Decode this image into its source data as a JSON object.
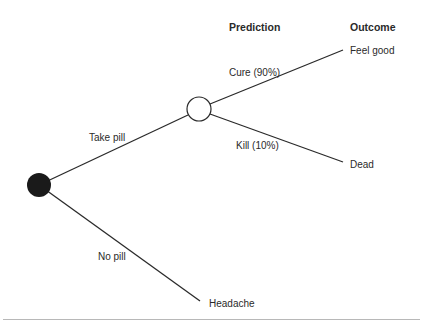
{
  "headers": {
    "prediction": "Prediction",
    "outcome": "Outcome"
  },
  "branches": {
    "take_pill": "Take pill",
    "no_pill": "No pill",
    "cure": "Cure (90%)",
    "kill": "Kill (10%)"
  },
  "outcomes": {
    "feel_good": "Feel good",
    "dead": "Dead",
    "headache": "Headache"
  },
  "nodes": {
    "decision": {
      "type": "decision-node",
      "fill": "#1a1a1a"
    },
    "chance": {
      "type": "chance-node",
      "fill": "#ffffff"
    }
  },
  "colors": {
    "line": "#2a2a2a",
    "rule": "#b8b8b8"
  }
}
